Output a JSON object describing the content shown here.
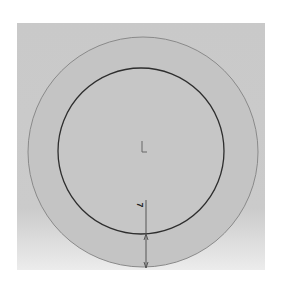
{
  "drawing": {
    "view": "top view of ring / annular part",
    "background_color": "#c9c9c9",
    "outer_circle": {
      "cx": 143,
      "cy": 152,
      "r": 115
    },
    "inner_circle": {
      "cx": 141,
      "cy": 151,
      "r": 83
    },
    "origin_marker": "L",
    "dimension": {
      "label": "7",
      "x": 146,
      "y1": 200,
      "y2": 268
    }
  }
}
